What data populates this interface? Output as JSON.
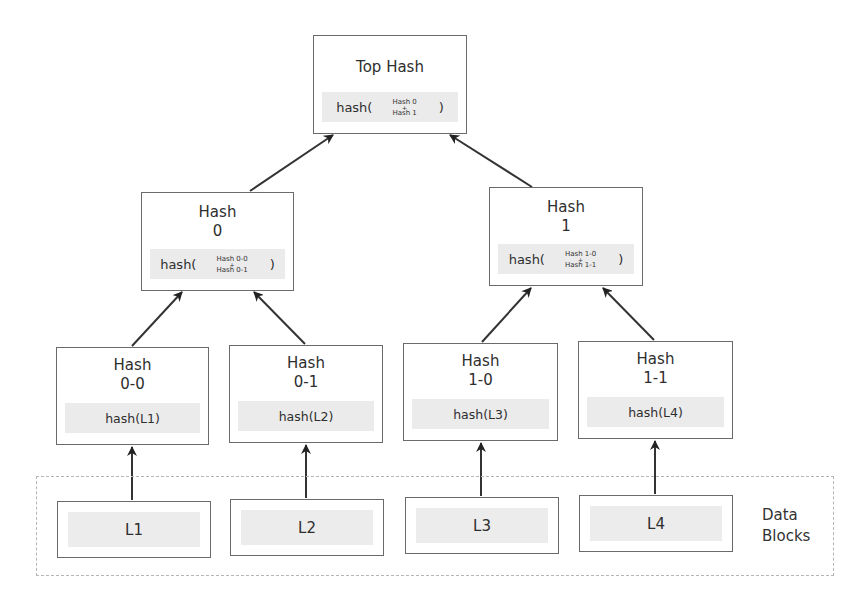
{
  "diagram": {
    "type": "merkle-tree",
    "root": {
      "title": "Top Hash",
      "formula": {
        "fn": "hash(",
        "args": [
          "Hash 0",
          "+",
          "Hash 1"
        ],
        "close": ")"
      }
    },
    "level1": [
      {
        "title_line1": "Hash",
        "title_line2": "0",
        "formula": {
          "fn": "hash(",
          "args": [
            "Hash 0-0",
            "+",
            "Hash 0-1"
          ],
          "close": ")"
        }
      },
      {
        "title_line1": "Hash",
        "title_line2": "1",
        "formula": {
          "fn": "hash(",
          "args": [
            "Hash 1-0",
            "+",
            "Hash 1-1"
          ],
          "close": ")"
        }
      }
    ],
    "level2": [
      {
        "title_line1": "Hash",
        "title_line2": "0-0",
        "formula": "hash(L1)"
      },
      {
        "title_line1": "Hash",
        "title_line2": "0-1",
        "formula": "hash(L2)"
      },
      {
        "title_line1": "Hash",
        "title_line2": "1-0",
        "formula": "hash(L3)"
      },
      {
        "title_line1": "Hash",
        "title_line2": "1-1",
        "formula": "hash(L4)"
      }
    ],
    "data_blocks": {
      "label_line1": "Data",
      "label_line2": "Blocks",
      "items": [
        "L1",
        "L2",
        "L3",
        "L4"
      ]
    },
    "edges": [
      {
        "from": "Hash 0",
        "to": "Top Hash"
      },
      {
        "from": "Hash 1",
        "to": "Top Hash"
      },
      {
        "from": "Hash 0-0",
        "to": "Hash 0"
      },
      {
        "from": "Hash 0-1",
        "to": "Hash 0"
      },
      {
        "from": "Hash 1-0",
        "to": "Hash 1"
      },
      {
        "from": "Hash 1-1",
        "to": "Hash 1"
      },
      {
        "from": "L1",
        "to": "Hash 0-0"
      },
      {
        "from": "L2",
        "to": "Hash 0-1"
      },
      {
        "from": "L3",
        "to": "Hash 1-0"
      },
      {
        "from": "L4",
        "to": "Hash 1-1"
      }
    ],
    "colors": {
      "box_border": "#6a6a6a",
      "hash_fill": "#ebebeb",
      "arrow": "#2a2a2a",
      "dashed_border": "#b5b5b5"
    }
  }
}
